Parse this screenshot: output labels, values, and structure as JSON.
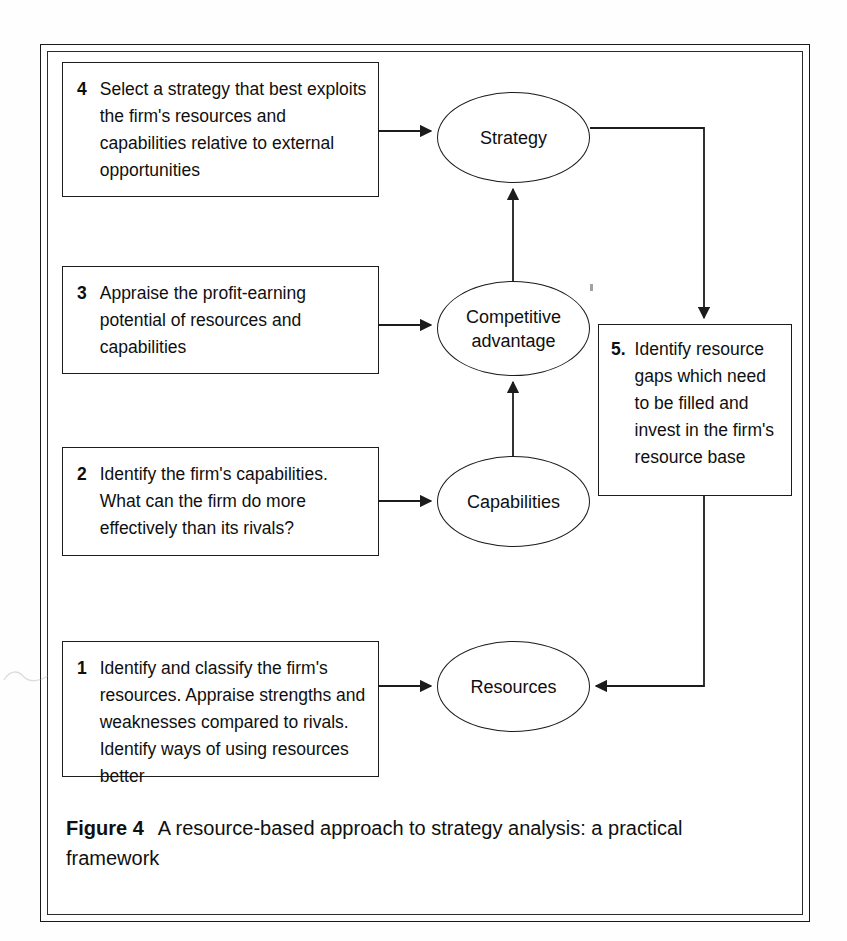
{
  "figure": {
    "caption_label": "Figure 4",
    "caption_text": "A resource-based approach to strategy analysis: a practical framework"
  },
  "steps": [
    {
      "id": "step-1",
      "number": "1",
      "text": "Identify and classify the firm's resources. Appraise strengths and weaknesses compared to rivals. Identify ways of using resources better"
    },
    {
      "id": "step-2",
      "number": "2",
      "text": "Identify the firm's capabilities. What can the firm do more effectively than its rivals?"
    },
    {
      "id": "step-3",
      "number": "3",
      "text": "Appraise the profit-earning potential of resources and capabilities"
    },
    {
      "id": "step-4",
      "number": "4",
      "text": "Select a strategy that best exploits the firm's resources and capabilities relative to external opportunities"
    },
    {
      "id": "step-5",
      "number": "5.",
      "text": "Identify resource gaps which need to be filled and invest in the firm's   resource base"
    }
  ],
  "nodes": [
    {
      "id": "node-resources",
      "label": "Resources"
    },
    {
      "id": "node-capabilities",
      "label": "Capabilities"
    },
    {
      "id": "node-competitive",
      "label": "Competitive\nadvantage"
    },
    {
      "id": "node-strategy",
      "label": "Strategy"
    }
  ],
  "connections": [
    {
      "from": "step-4",
      "to": "node-strategy",
      "style": "arrow-right"
    },
    {
      "from": "step-3",
      "to": "node-competitive",
      "style": "arrow-right"
    },
    {
      "from": "step-2",
      "to": "node-capabilities",
      "style": "arrow-right"
    },
    {
      "from": "step-1",
      "to": "node-resources",
      "style": "arrow-right"
    },
    {
      "from": "node-capabilities",
      "to": "node-competitive",
      "style": "arrow-up"
    },
    {
      "from": "node-competitive",
      "to": "node-strategy",
      "style": "arrow-up"
    },
    {
      "from": "node-strategy",
      "to": "step-5",
      "style": "elbow-right-down-arrow"
    },
    {
      "from": "step-5",
      "to": "node-resources",
      "style": "elbow-down-left-arrow"
    }
  ],
  "colors": {
    "ink": "#1c1c1c",
    "page_background": "#ffffff",
    "text": "#0f0f0f"
  }
}
